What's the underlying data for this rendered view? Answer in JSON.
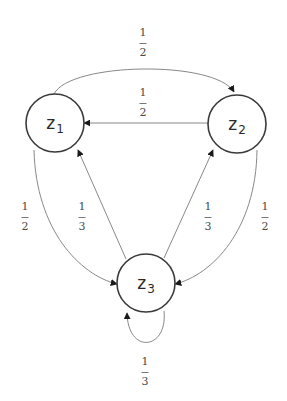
{
  "diagram": {
    "type": "markov-chain",
    "nodes": [
      {
        "id": "z1",
        "base": "z",
        "sub": "1",
        "cx": 55,
        "cy": 123
      },
      {
        "id": "z2",
        "base": "z",
        "sub": "2",
        "cx": 237,
        "cy": 124
      },
      {
        "id": "z3",
        "base": "z",
        "sub": "3",
        "cx": 146,
        "cy": 283
      }
    ],
    "edges": [
      {
        "from": "z1",
        "to": "z2",
        "num": "1",
        "den": "2",
        "label_pos": [
          143,
          33
        ]
      },
      {
        "from": "z2",
        "to": "z1",
        "num": "1",
        "den": "2",
        "label_pos": [
          143,
          87
        ]
      },
      {
        "from": "z1",
        "to": "z3",
        "num": "1",
        "den": "2",
        "label_pos": [
          25,
          201
        ]
      },
      {
        "from": "z3",
        "to": "z1",
        "num": "1",
        "den": "3",
        "label_pos": [
          82,
          201
        ]
      },
      {
        "from": "z3",
        "to": "z2",
        "num": "1",
        "den": "3",
        "label_pos": [
          208,
          201
        ]
      },
      {
        "from": "z2",
        "to": "z3",
        "num": "1",
        "den": "2",
        "label_pos": [
          265,
          201
        ]
      },
      {
        "from": "z3",
        "to": "z3",
        "num": "1",
        "den": "3",
        "label_pos": [
          145,
          356
        ]
      }
    ]
  }
}
